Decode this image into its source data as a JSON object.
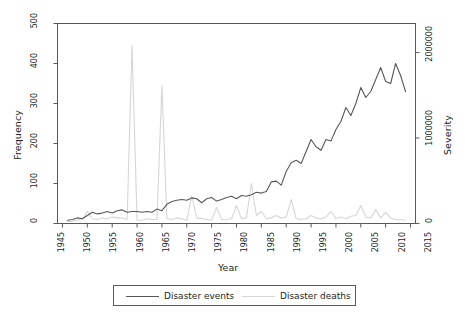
{
  "chart_data": {
    "type": "line",
    "title": "",
    "xlabel": "Year",
    "ylabel": "Frequency",
    "y2label": "Severity",
    "xlim": [
      1944,
      2016
    ],
    "ylim": [
      0,
      500
    ],
    "y2lim": [
      0,
      2340000
    ],
    "grid": false,
    "legend_position": "bottom",
    "xticks": [
      1945,
      1950,
      1955,
      1960,
      1965,
      1970,
      1975,
      1980,
      1985,
      1990,
      1995,
      2000,
      2005,
      2010,
      2015
    ],
    "xtick_labels": [
      "1945",
      "1950",
      "1955",
      "1960",
      "1965",
      "1970",
      "1975",
      "1980",
      "1985",
      "1990",
      "1995",
      "2000",
      "2005",
      "2010",
      "2015"
    ],
    "yticks": [
      0,
      100,
      200,
      300,
      400,
      500
    ],
    "ytick_labels": [
      "0",
      "100",
      "200",
      "300",
      "400",
      "500"
    ],
    "y2ticks": [
      0,
      1000000,
      2000000
    ],
    "y2tick_labels": [
      "0",
      "1000000",
      "2000000"
    ],
    "colors": {
      "events": "#58595b",
      "deaths": "#d6d6d6",
      "axis": "#58595b",
      "text": "#231f20"
    },
    "x": [
      1946,
      1947,
      1948,
      1949,
      1950,
      1951,
      1952,
      1953,
      1954,
      1955,
      1956,
      1957,
      1958,
      1959,
      1960,
      1961,
      1962,
      1963,
      1964,
      1965,
      1966,
      1967,
      1968,
      1969,
      1970,
      1971,
      1972,
      1973,
      1974,
      1975,
      1976,
      1977,
      1978,
      1979,
      1980,
      1981,
      1982,
      1983,
      1984,
      1985,
      1986,
      1987,
      1988,
      1989,
      1990,
      1991,
      1992,
      1993,
      1994,
      1995,
      1996,
      1997,
      1998,
      1999,
      2000,
      2001,
      2002,
      2003,
      2004,
      2005,
      2006,
      2007,
      2008,
      2009,
      2010,
      2011,
      2012,
      2013,
      2014
    ],
    "series": [
      {
        "name": "Disaster events",
        "axis": "left",
        "color": "#58595b",
        "values": [
          8,
          10,
          14,
          12,
          20,
          28,
          24,
          26,
          30,
          26,
          32,
          34,
          28,
          30,
          30,
          28,
          30,
          28,
          36,
          32,
          48,
          55,
          58,
          60,
          58,
          64,
          62,
          52,
          62,
          65,
          56,
          60,
          65,
          68,
          62,
          70,
          68,
          72,
          78,
          76,
          80,
          104,
          106,
          96,
          130,
          152,
          158,
          150,
          180,
          210,
          192,
          183,
          210,
          206,
          235,
          255,
          290,
          270,
          300,
          340,
          315,
          330,
          360,
          390,
          355,
          350,
          400,
          370,
          330
        ],
        "label_at_peak": 400
      },
      {
        "name": "Disaster deaths",
        "axis": "right",
        "color": "#d6d6d6",
        "values_frequency_scale": [
          5,
          6,
          8,
          10,
          30,
          12,
          10,
          14,
          12,
          16,
          14,
          14,
          10,
          445,
          8,
          8,
          12,
          10,
          10,
          345,
          12,
          10,
          14,
          12,
          8,
          70,
          14,
          12,
          10,
          8,
          40,
          10,
          10,
          12,
          45,
          12,
          14,
          100,
          20,
          30,
          12,
          14,
          20,
          14,
          16,
          60,
          12,
          10,
          12,
          20,
          14,
          12,
          16,
          30,
          12,
          16,
          12,
          18,
          20,
          45,
          16,
          14,
          35,
          14,
          28,
          14,
          10,
          10,
          8
        ],
        "note": "gray curve plotted against right-hand Severity axis; 445 on the left grid corresponds to roughly 2,080,000 deaths"
      }
    ]
  },
  "axes": {
    "ylabel": "Frequency",
    "y2label": "Severity",
    "xlabel": "Year"
  },
  "legend": {
    "items": [
      {
        "label": "Disaster events",
        "color": "#58595b"
      },
      {
        "label": "Disaster deaths",
        "color": "#d6d6d6"
      }
    ]
  }
}
